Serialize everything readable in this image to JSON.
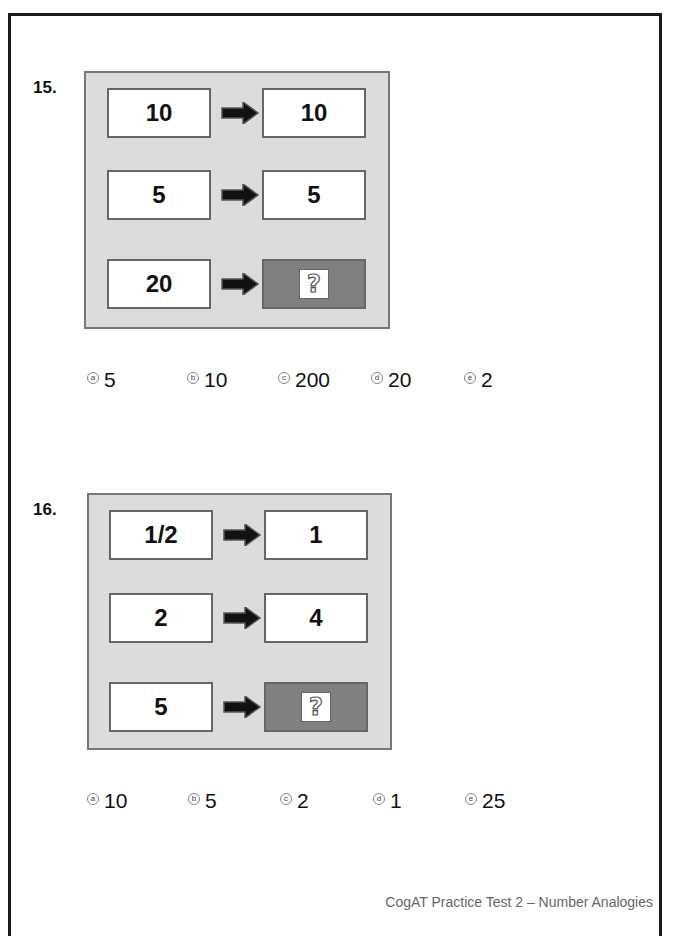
{
  "footer": "CogAT Practice Test 2 – Number Analogies",
  "colors": {
    "panel_bg": "#dcdcdc",
    "answer_box": "#808080",
    "border": "#666666"
  },
  "questions": [
    {
      "number": "15.",
      "rows": [
        {
          "left": "10",
          "right": "10"
        },
        {
          "left": "5",
          "right": "5"
        },
        {
          "left": "20",
          "right": "?"
        }
      ],
      "choices": [
        {
          "letter": "a",
          "value": "5"
        },
        {
          "letter": "b",
          "value": "10"
        },
        {
          "letter": "c",
          "value": "200"
        },
        {
          "letter": "d",
          "value": "20"
        },
        {
          "letter": "e",
          "value": "2"
        }
      ]
    },
    {
      "number": "16.",
      "rows": [
        {
          "left": "1/2",
          "right": "1"
        },
        {
          "left": "2",
          "right": "4"
        },
        {
          "left": "5",
          "right": "?"
        }
      ],
      "choices": [
        {
          "letter": "a",
          "value": "10"
        },
        {
          "letter": "b",
          "value": "5"
        },
        {
          "letter": "c",
          "value": "2"
        },
        {
          "letter": "d",
          "value": "1"
        },
        {
          "letter": "e",
          "value": "25"
        }
      ]
    }
  ],
  "icons": {
    "arrow": "right-arrow-icon",
    "unknown": "question-mark-icon",
    "choice_bubble": "answer-bubble-icon"
  }
}
